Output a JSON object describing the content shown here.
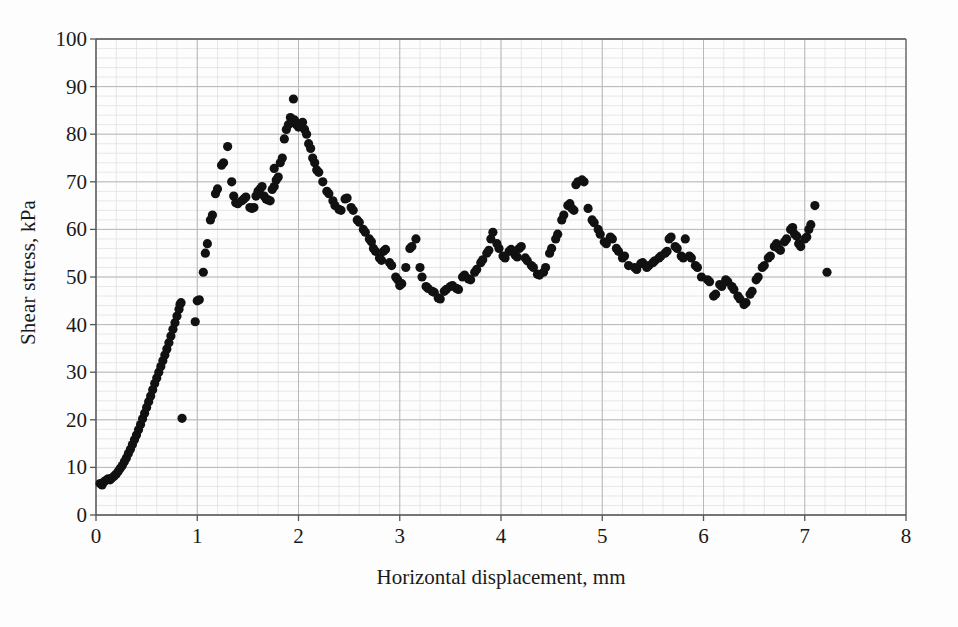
{
  "chart_data": {
    "type": "scatter",
    "title": "",
    "xlabel": "Horizontal displacement, mm",
    "ylabel": "Shear stress, kPa",
    "xlim": [
      0,
      8
    ],
    "ylim": [
      0,
      100
    ],
    "xticks": [
      0,
      1,
      2,
      3,
      4,
      5,
      6,
      7,
      8
    ],
    "yticks": [
      0,
      10,
      20,
      30,
      40,
      50,
      60,
      70,
      80,
      90,
      100
    ],
    "x_major_step": 1,
    "x_minor_step": 0.2,
    "y_major_step": 10,
    "y_minor_step": 2,
    "grid": "major and minor, light gray",
    "legend": "none",
    "marker": {
      "shape": "circle",
      "color": "#111111",
      "size_px": 9
    },
    "series": [
      {
        "name": "Shear stress vs horizontal displacement",
        "points": [
          [
            0.04,
            6.6
          ],
          [
            0.06,
            6.3
          ],
          [
            0.08,
            7.0
          ],
          [
            0.1,
            7.3
          ],
          [
            0.12,
            7.6
          ],
          [
            0.14,
            7.4
          ],
          [
            0.16,
            7.8
          ],
          [
            0.18,
            8.2
          ],
          [
            0.2,
            8.6
          ],
          [
            0.22,
            9.2
          ],
          [
            0.24,
            9.8
          ],
          [
            0.26,
            10.4
          ],
          [
            0.28,
            11.2
          ],
          [
            0.3,
            12.0
          ],
          [
            0.32,
            12.9
          ],
          [
            0.34,
            13.8
          ],
          [
            0.36,
            14.8
          ],
          [
            0.38,
            15.8
          ],
          [
            0.4,
            16.8
          ],
          [
            0.42,
            17.9
          ],
          [
            0.44,
            19.0
          ],
          [
            0.46,
            20.2
          ],
          [
            0.48,
            21.4
          ],
          [
            0.5,
            22.6
          ],
          [
            0.52,
            23.8
          ],
          [
            0.54,
            25.0
          ],
          [
            0.56,
            26.3
          ],
          [
            0.58,
            27.6
          ],
          [
            0.6,
            28.8
          ],
          [
            0.62,
            30.0
          ],
          [
            0.64,
            31.2
          ],
          [
            0.66,
            32.4
          ],
          [
            0.68,
            33.6
          ],
          [
            0.7,
            34.9
          ],
          [
            0.72,
            36.2
          ],
          [
            0.74,
            37.6
          ],
          [
            0.76,
            39.0
          ],
          [
            0.78,
            40.4
          ],
          [
            0.8,
            41.8
          ],
          [
            0.82,
            43.2
          ],
          [
            0.83,
            44.3
          ],
          [
            0.84,
            44.6
          ],
          [
            0.85,
            20.3
          ],
          [
            0.98,
            40.6
          ],
          [
            1.0,
            45.0
          ],
          [
            1.02,
            45.2
          ],
          [
            1.06,
            51.0
          ],
          [
            1.08,
            55.0
          ],
          [
            1.1,
            57.0
          ],
          [
            1.13,
            62.0
          ],
          [
            1.15,
            63.0
          ],
          [
            1.18,
            67.5
          ],
          [
            1.2,
            68.5
          ],
          [
            1.24,
            73.5
          ],
          [
            1.26,
            74.0
          ],
          [
            1.3,
            77.4
          ],
          [
            1.34,
            70.0
          ],
          [
            1.36,
            67.0
          ],
          [
            1.38,
            65.6
          ],
          [
            1.4,
            65.4
          ],
          [
            1.44,
            66.0
          ],
          [
            1.46,
            66.4
          ],
          [
            1.48,
            66.8
          ],
          [
            1.52,
            64.6
          ],
          [
            1.54,
            64.4
          ],
          [
            1.56,
            64.6
          ],
          [
            1.58,
            67.0
          ],
          [
            1.6,
            68.0
          ],
          [
            1.62,
            68.5
          ],
          [
            1.64,
            69.0
          ],
          [
            1.66,
            67.0
          ],
          [
            1.68,
            66.4
          ],
          [
            1.7,
            66.2
          ],
          [
            1.72,
            66.0
          ],
          [
            1.74,
            68.4
          ],
          [
            1.76,
            69.0
          ],
          [
            1.78,
            70.4
          ],
          [
            1.8,
            71.0
          ],
          [
            1.76,
            72.8
          ],
          [
            1.82,
            74.0
          ],
          [
            1.84,
            75.0
          ],
          [
            1.86,
            79.0
          ],
          [
            1.88,
            81.0
          ],
          [
            1.9,
            82.0
          ],
          [
            1.92,
            83.5
          ],
          [
            1.94,
            82.5
          ],
          [
            1.96,
            83.0
          ],
          [
            1.95,
            87.4
          ],
          [
            1.98,
            82.0
          ],
          [
            2.0,
            81.5
          ],
          [
            2.02,
            82.0
          ],
          [
            2.04,
            82.5
          ],
          [
            2.06,
            81.0
          ],
          [
            2.08,
            80.0
          ],
          [
            2.1,
            78.0
          ],
          [
            2.12,
            77.0
          ],
          [
            2.14,
            75.0
          ],
          [
            2.16,
            74.0
          ],
          [
            2.18,
            72.5
          ],
          [
            2.2,
            72.0
          ],
          [
            2.24,
            70.0
          ],
          [
            2.28,
            68.0
          ],
          [
            2.3,
            67.5
          ],
          [
            2.34,
            66.0
          ],
          [
            2.36,
            65.0
          ],
          [
            2.4,
            64.2
          ],
          [
            2.42,
            64.0
          ],
          [
            2.46,
            66.4
          ],
          [
            2.48,
            66.6
          ],
          [
            2.52,
            64.6
          ],
          [
            2.54,
            64.0
          ],
          [
            2.58,
            62.0
          ],
          [
            2.6,
            61.5
          ],
          [
            2.64,
            60.0
          ],
          [
            2.66,
            59.4
          ],
          [
            2.7,
            58.0
          ],
          [
            2.72,
            57.4
          ],
          [
            2.74,
            56.0
          ],
          [
            2.76,
            55.4
          ],
          [
            2.8,
            54.0
          ],
          [
            2.82,
            53.5
          ],
          [
            2.84,
            55.4
          ],
          [
            2.86,
            55.8
          ],
          [
            2.9,
            53.0
          ],
          [
            2.92,
            52.4
          ],
          [
            2.96,
            50.0
          ],
          [
            2.98,
            49.4
          ],
          [
            3.0,
            48.2
          ],
          [
            3.02,
            48.6
          ],
          [
            3.06,
            52.0
          ],
          [
            3.1,
            56.0
          ],
          [
            3.12,
            56.4
          ],
          [
            3.16,
            58.0
          ],
          [
            3.2,
            52.0
          ],
          [
            3.22,
            50.0
          ],
          [
            3.26,
            48.0
          ],
          [
            3.28,
            47.6
          ],
          [
            3.32,
            47.0
          ],
          [
            3.34,
            46.8
          ],
          [
            3.38,
            45.6
          ],
          [
            3.4,
            45.4
          ],
          [
            3.44,
            47.0
          ],
          [
            3.46,
            47.4
          ],
          [
            3.5,
            48.0
          ],
          [
            3.52,
            48.2
          ],
          [
            3.56,
            47.6
          ],
          [
            3.58,
            47.4
          ],
          [
            3.62,
            50.0
          ],
          [
            3.64,
            50.4
          ],
          [
            3.68,
            49.6
          ],
          [
            3.7,
            49.4
          ],
          [
            3.74,
            51.0
          ],
          [
            3.76,
            51.6
          ],
          [
            3.8,
            53.0
          ],
          [
            3.82,
            53.6
          ],
          [
            3.86,
            55.0
          ],
          [
            3.88,
            55.6
          ],
          [
            3.9,
            58.0
          ],
          [
            3.92,
            59.4
          ],
          [
            3.96,
            57.0
          ],
          [
            3.98,
            56.0
          ],
          [
            4.02,
            54.4
          ],
          [
            4.04,
            54.0
          ],
          [
            4.08,
            55.4
          ],
          [
            4.1,
            55.8
          ],
          [
            4.14,
            54.6
          ],
          [
            4.16,
            54.2
          ],
          [
            4.18,
            56.0
          ],
          [
            4.2,
            56.4
          ],
          [
            4.24,
            54.0
          ],
          [
            4.26,
            53.4
          ],
          [
            4.3,
            52.4
          ],
          [
            4.32,
            52.0
          ],
          [
            4.36,
            50.6
          ],
          [
            4.38,
            50.4
          ],
          [
            4.42,
            51.0
          ],
          [
            4.44,
            52.0
          ],
          [
            4.48,
            55.0
          ],
          [
            4.5,
            56.0
          ],
          [
            4.54,
            58.0
          ],
          [
            4.56,
            59.0
          ],
          [
            4.6,
            62.0
          ],
          [
            4.62,
            63.0
          ],
          [
            4.66,
            65.0
          ],
          [
            4.68,
            65.4
          ],
          [
            4.7,
            64.4
          ],
          [
            4.72,
            64.0
          ],
          [
            4.74,
            69.4
          ],
          [
            4.76,
            70.0
          ],
          [
            4.8,
            70.4
          ],
          [
            4.82,
            70.0
          ],
          [
            4.86,
            64.4
          ],
          [
            4.9,
            62.0
          ],
          [
            4.92,
            61.4
          ],
          [
            4.96,
            60.0
          ],
          [
            4.98,
            59.0
          ],
          [
            5.02,
            57.4
          ],
          [
            5.04,
            57.0
          ],
          [
            5.08,
            58.4
          ],
          [
            5.1,
            58.0
          ],
          [
            5.14,
            56.0
          ],
          [
            5.16,
            55.4
          ],
          [
            5.2,
            54.0
          ],
          [
            5.22,
            54.4
          ],
          [
            5.26,
            52.4
          ],
          [
            5.32,
            52.0
          ],
          [
            5.34,
            51.6
          ],
          [
            5.38,
            52.8
          ],
          [
            5.4,
            53.0
          ],
          [
            5.44,
            52.0
          ],
          [
            5.46,
            52.4
          ],
          [
            5.5,
            53.0
          ],
          [
            5.52,
            53.4
          ],
          [
            5.56,
            54.0
          ],
          [
            5.58,
            54.4
          ],
          [
            5.62,
            55.0
          ],
          [
            5.64,
            55.4
          ],
          [
            5.66,
            58.0
          ],
          [
            5.68,
            58.4
          ],
          [
            5.72,
            56.4
          ],
          [
            5.74,
            56.0
          ],
          [
            5.78,
            54.4
          ],
          [
            5.8,
            54.0
          ],
          [
            5.82,
            58.0
          ],
          [
            5.86,
            54.4
          ],
          [
            5.88,
            54.0
          ],
          [
            5.92,
            52.4
          ],
          [
            5.94,
            52.0
          ],
          [
            5.98,
            50.0
          ],
          [
            6.04,
            49.4
          ],
          [
            6.06,
            49.0
          ],
          [
            6.1,
            46.0
          ],
          [
            6.12,
            46.4
          ],
          [
            6.16,
            48.4
          ],
          [
            6.18,
            48.0
          ],
          [
            6.22,
            49.4
          ],
          [
            6.24,
            49.0
          ],
          [
            6.28,
            48.0
          ],
          [
            6.3,
            47.4
          ],
          [
            6.34,
            46.0
          ],
          [
            6.36,
            45.4
          ],
          [
            6.4,
            44.2
          ],
          [
            6.42,
            44.6
          ],
          [
            6.46,
            46.4
          ],
          [
            6.48,
            47.0
          ],
          [
            6.52,
            49.4
          ],
          [
            6.54,
            50.0
          ],
          [
            6.58,
            52.0
          ],
          [
            6.6,
            52.4
          ],
          [
            6.64,
            54.0
          ],
          [
            6.66,
            54.4
          ],
          [
            6.7,
            56.4
          ],
          [
            6.72,
            57.0
          ],
          [
            6.74,
            56.0
          ],
          [
            6.76,
            55.6
          ],
          [
            6.8,
            57.4
          ],
          [
            6.82,
            58.0
          ],
          [
            6.86,
            60.0
          ],
          [
            6.88,
            60.4
          ],
          [
            6.9,
            59.0
          ],
          [
            6.92,
            58.6
          ],
          [
            6.94,
            57.0
          ],
          [
            6.96,
            56.4
          ],
          [
            7.0,
            58.0
          ],
          [
            7.02,
            58.4
          ],
          [
            7.04,
            60.0
          ],
          [
            7.06,
            61.0
          ],
          [
            7.1,
            65.0
          ],
          [
            7.22,
            51.0
          ]
        ]
      }
    ]
  },
  "axes": {
    "x_tick_labels": [
      "0",
      "1",
      "2",
      "3",
      "4",
      "5",
      "6",
      "7",
      "8"
    ],
    "y_tick_labels": [
      "0",
      "10",
      "20",
      "30",
      "40",
      "50",
      "60",
      "70",
      "80",
      "90",
      "100"
    ],
    "x_title": "Horizontal displacement, mm",
    "y_title": "Shear stress, kPa"
  },
  "style": {
    "background": "#fdfdfd",
    "axis_color": "#555555",
    "grid_major": "#b8b8b8",
    "grid_minor": "#dedede",
    "marker_color": "#111111"
  }
}
